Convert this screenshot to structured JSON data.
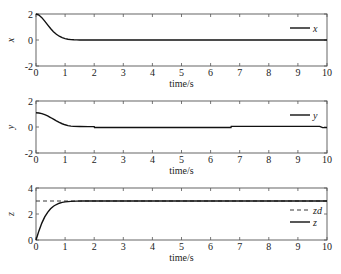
{
  "chart_data": [
    {
      "type": "line",
      "xlabel": "time/s",
      "ylabel": "x",
      "xlim": [
        0,
        10
      ],
      "ylim": [
        -2,
        2
      ],
      "xticks": [
        0,
        1,
        2,
        3,
        4,
        5,
        6,
        7,
        8,
        9,
        10
      ],
      "yticks": [
        -2,
        0,
        2
      ],
      "legend_position": "top-right",
      "series": [
        {
          "name": "x",
          "style": "solid",
          "x": [
            0,
            0.1,
            0.2,
            0.3,
            0.4,
            0.5,
            0.6,
            0.7,
            0.8,
            0.9,
            1.0,
            1.1,
            1.2,
            1.3,
            1.4,
            1.5,
            1.7,
            2.0,
            3,
            4,
            5,
            6,
            7,
            8,
            9,
            10
          ],
          "y": [
            2.0,
            1.92,
            1.72,
            1.45,
            1.16,
            0.88,
            0.64,
            0.44,
            0.29,
            0.18,
            0.11,
            0.06,
            0.03,
            0.015,
            0.007,
            0.003,
            0.001,
            0,
            0,
            0,
            0,
            0,
            0,
            0,
            0,
            0
          ]
        }
      ]
    },
    {
      "type": "line",
      "xlabel": "time/s",
      "ylabel": "y",
      "xlim": [
        0,
        10
      ],
      "ylim": [
        -2,
        2
      ],
      "xticks": [
        0,
        1,
        2,
        3,
        4,
        5,
        6,
        7,
        8,
        9,
        10
      ],
      "yticks": [
        -2,
        0,
        2
      ],
      "legend_position": "top-right",
      "series": [
        {
          "name": "y",
          "style": "solid",
          "x": [
            0,
            0.1,
            0.2,
            0.3,
            0.4,
            0.5,
            0.6,
            0.7,
            0.8,
            0.9,
            1.0,
            1.1,
            1.2,
            1.3,
            1.5,
            1.8,
            2.0,
            2.01,
            6.7,
            6.71,
            9.75,
            9.85,
            10
          ],
          "y": [
            1.1,
            1.08,
            1.03,
            0.95,
            0.85,
            0.73,
            0.6,
            0.47,
            0.35,
            0.25,
            0.17,
            0.11,
            0.07,
            0.05,
            0.04,
            0.03,
            0.03,
            -0.04,
            -0.04,
            0.05,
            0.05,
            -0.05,
            -0.05
          ]
        }
      ]
    },
    {
      "type": "line",
      "xlabel": "time/s",
      "ylabel": "z",
      "xlim": [
        0,
        10
      ],
      "ylim": [
        0,
        4
      ],
      "xticks": [
        0,
        1,
        2,
        3,
        4,
        5,
        6,
        7,
        8,
        9,
        10
      ],
      "yticks": [
        0,
        2,
        4
      ],
      "legend_position": "right",
      "series": [
        {
          "name": "zd",
          "style": "dashed",
          "x": [
            0,
            10
          ],
          "y": [
            3,
            3
          ]
        },
        {
          "name": "z",
          "style": "solid",
          "x": [
            0,
            0.05,
            0.1,
            0.2,
            0.3,
            0.4,
            0.5,
            0.6,
            0.7,
            0.8,
            0.9,
            1.0,
            1.2,
            1.4,
            1.6,
            2.0,
            3,
            4,
            5,
            6,
            7,
            8,
            9,
            10
          ],
          "y": [
            0,
            0.35,
            0.7,
            1.3,
            1.78,
            2.13,
            2.4,
            2.6,
            2.73,
            2.83,
            2.89,
            2.93,
            2.97,
            2.99,
            3.0,
            3.0,
            3.0,
            3.0,
            3.0,
            3.0,
            3.0,
            3.0,
            3.0,
            3.0
          ]
        }
      ]
    }
  ]
}
